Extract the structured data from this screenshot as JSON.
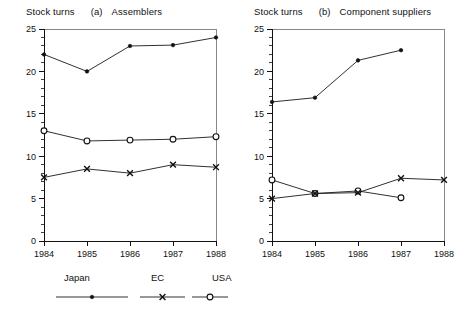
{
  "figure": {
    "axis_label": "Stock turns",
    "x_ticks": [
      "1984",
      "1985",
      "1986",
      "1987",
      "1988"
    ],
    "y_ticks": [
      "0",
      "5",
      "10",
      "15",
      "20",
      "25"
    ]
  },
  "panel_a": {
    "tag": "(a)",
    "name": "Assemblers",
    "ylabel": "Stock turns"
  },
  "panel_b": {
    "tag": "(b)",
    "name": "Component suppliers",
    "ylabel": "Stock turns"
  },
  "legend": {
    "items": [
      {
        "label": "Japan",
        "marker": "filled-dot"
      },
      {
        "label": "EC",
        "marker": "x-cross"
      },
      {
        "label": "USA",
        "marker": "open-circle"
      }
    ]
  },
  "chart_data": [
    {
      "type": "line",
      "title": "(a) Assemblers",
      "xlabel": "",
      "ylabel": "Stock turns",
      "x": [
        1984,
        1985,
        1986,
        1987,
        1988
      ],
      "xtick_labels": [
        "1984",
        "1985",
        "1986",
        "1987",
        "1988"
      ],
      "ylim": [
        0,
        25
      ],
      "ytick_labels": [
        "0",
        "5",
        "10",
        "15",
        "20",
        "25"
      ],
      "y_major_step": 5,
      "y_minor_step": 1,
      "grid": false,
      "legend_position": "below-figure",
      "series": [
        {
          "name": "Japan",
          "marker": "filled-dot",
          "x": [
            1984,
            1985,
            1986,
            1987,
            1988
          ],
          "values": [
            22.0,
            20.0,
            23.0,
            23.1,
            24.0
          ]
        },
        {
          "name": "USA",
          "marker": "open-circle",
          "x": [
            1984,
            1985,
            1986,
            1987,
            1988
          ],
          "values": [
            13.0,
            11.8,
            11.9,
            12.0,
            12.3
          ]
        },
        {
          "name": "EC",
          "marker": "x-cross",
          "x": [
            1984,
            1985,
            1986,
            1987,
            1988
          ],
          "values": [
            7.5,
            8.5,
            8.0,
            9.0,
            8.7
          ]
        }
      ]
    },
    {
      "type": "line",
      "title": "(b) Component suppliers",
      "xlabel": "",
      "ylabel": "Stock turns",
      "x": [
        1984,
        1985,
        1986,
        1987,
        1988
      ],
      "xtick_labels": [
        "1984",
        "1985",
        "1986",
        "1987",
        "1988"
      ],
      "ylim": [
        0,
        25
      ],
      "ytick_labels": [
        "0",
        "5",
        "10",
        "15",
        "20",
        "25"
      ],
      "y_major_step": 5,
      "y_minor_step": 1,
      "grid": false,
      "legend_position": "below-figure",
      "series": [
        {
          "name": "Japan",
          "marker": "filled-dot",
          "x": [
            1984,
            1985,
            1986,
            1987
          ],
          "values": [
            16.4,
            16.9,
            21.3,
            22.5
          ]
        },
        {
          "name": "USA",
          "marker": "open-circle",
          "x": [
            1984,
            1985,
            1986,
            1987
          ],
          "values": [
            7.2,
            5.6,
            5.9,
            5.1
          ]
        },
        {
          "name": "EC",
          "marker": "x-cross",
          "x": [
            1984,
            1985,
            1986,
            1987,
            1988
          ],
          "values": [
            5.0,
            5.6,
            5.7,
            7.4,
            7.2
          ]
        }
      ]
    }
  ]
}
